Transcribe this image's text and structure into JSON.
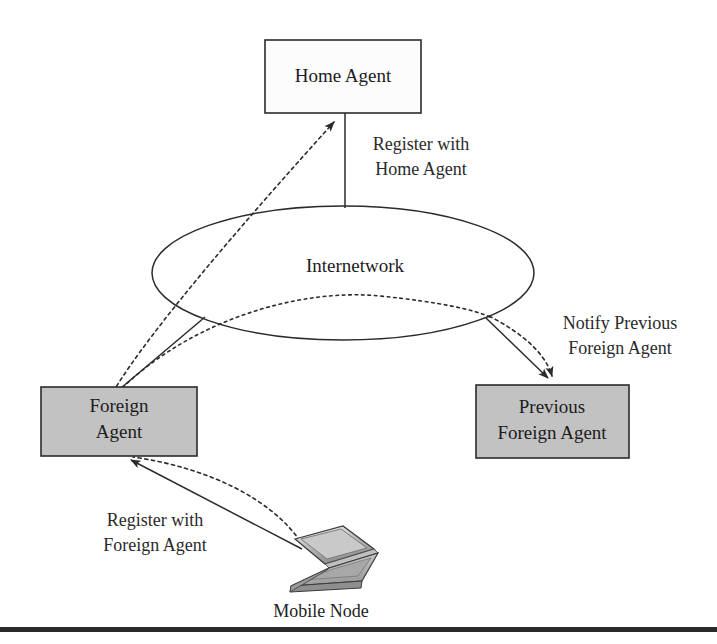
{
  "diagram": {
    "background_color": "#ffffff",
    "line_color": "#2b2b2b",
    "shaded_fill": "#c2c2c2",
    "plain_fill": "#fcfcfc"
  },
  "nodes": {
    "home_agent": {
      "label": "Home Agent",
      "line1": "Home Agent",
      "line2": "",
      "fill": "#fcfcfc",
      "x": 265,
      "y": 40,
      "w": 156,
      "h": 73
    },
    "foreign_agent": {
      "label": "Foreign Agent",
      "line1": "Foreign",
      "line2": "Agent",
      "fill": "#c2c2c2",
      "x": 41,
      "y": 387,
      "w": 156,
      "h": 69
    },
    "previous_foreign_agent": {
      "label": "Previous Foreign Agent",
      "line1": "Previous",
      "line2": "Foreign Agent",
      "fill": "#c2c2c2",
      "x": 476,
      "y": 385,
      "w": 153,
      "h": 73
    },
    "internetwork": {
      "label": "Internetwork",
      "cx": 343,
      "cy": 273,
      "rx": 191,
      "ry": 67
    },
    "mobile_node": {
      "label": "Mobile Node",
      "icon": "laptop-icon",
      "cx": 312,
      "cy": 560
    }
  },
  "edge_labels": {
    "register_home": {
      "line1": "Register with",
      "line2": "Home Agent"
    },
    "notify_previous": {
      "line1": "Notify Previous",
      "line2": "Foreign Agent"
    },
    "register_foreign": {
      "line1": "Register with",
      "line2": "Foreign Agent"
    }
  },
  "connections": [
    {
      "name": "home-agent-to-internetwork",
      "style": "solid",
      "from": "home_agent",
      "to": "internetwork",
      "arrow": false
    },
    {
      "name": "foreign-agent-to-home-agent",
      "style": "dashed",
      "from": "foreign_agent",
      "to": "home_agent",
      "arrow": true
    },
    {
      "name": "foreign-agent-to-internetwork",
      "style": "solid",
      "from": "foreign_agent",
      "to": "internetwork",
      "arrow": false
    },
    {
      "name": "internetwork-to-previous-foreign-agent",
      "style": "solid",
      "from": "internetwork",
      "to": "previous_foreign_agent",
      "arrow": true
    },
    {
      "name": "tunnel-to-previous-foreign-agent",
      "style": "dashed",
      "from": "internetwork",
      "to": "previous_foreign_agent",
      "arrow": true
    },
    {
      "name": "mobile-node-to-foreign-agent-solid",
      "style": "solid",
      "from": "mobile_node",
      "to": "foreign_agent",
      "arrow": true
    },
    {
      "name": "mobile-node-to-foreign-agent-dashed",
      "style": "dashed",
      "from": "mobile_node",
      "to": "foreign_agent",
      "arrow": false
    },
    {
      "name": "internetwork-tunnel-path",
      "style": "dashed",
      "from": "foreign_agent",
      "to": "previous_foreign_agent",
      "arrow": false
    }
  ]
}
